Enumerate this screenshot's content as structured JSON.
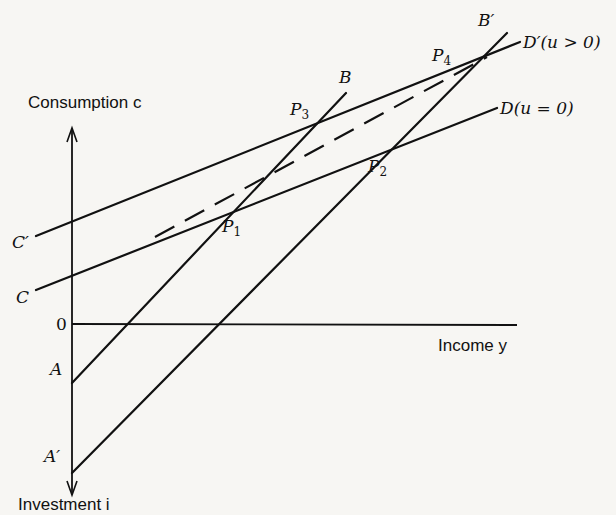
{
  "axes": {
    "y_label": "Consumption c",
    "y_label_neg": "Investment i",
    "x_label": "Income y",
    "origin_label": "0"
  },
  "labels": {
    "C": "C",
    "C_prime": "C′",
    "A": "A",
    "A_prime": "A′",
    "B": "B",
    "B_prime": "B′",
    "D": "D(u = 0)",
    "D_prime": "D′(u > 0)",
    "P1": "P",
    "P1_sub": "1",
    "P2": "P",
    "P2_sub": "2",
    "P3": "P",
    "P3_sub": "3",
    "P4": "P",
    "P4_sub": "4"
  },
  "lines": [
    {
      "name": "CD",
      "from": [
        36,
        290
      ],
      "to": [
        497,
        108
      ],
      "style": "solid"
    },
    {
      "name": "C'D'",
      "from": [
        36,
        236
      ],
      "to": [
        520,
        42
      ],
      "style": "solid"
    },
    {
      "name": "AB",
      "from": [
        72,
        383
      ],
      "to": [
        346,
        93
      ],
      "style": "solid"
    },
    {
      "name": "A'B'",
      "from": [
        72,
        473
      ],
      "to": [
        507,
        33
      ],
      "style": "solid"
    },
    {
      "name": "dashed",
      "from": [
        155,
        237
      ],
      "to": [
        487,
        57
      ],
      "style": "dashed"
    }
  ],
  "points": {
    "P1": [
      223,
      212
    ],
    "P2": [
      367,
      157
    ],
    "P3": [
      316,
      119
    ],
    "P4": [
      455,
      63
    ]
  }
}
